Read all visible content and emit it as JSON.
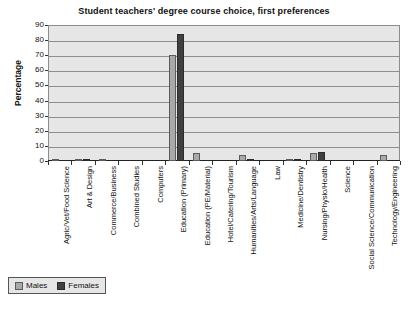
{
  "chart_data": {
    "type": "bar",
    "title": "Student teachers' degree course choice, first preferences",
    "xlabel": "",
    "ylabel": "Percentage",
    "ylim": [
      0,
      90
    ],
    "ytick_step": 10,
    "yticks": [
      0,
      10,
      20,
      30,
      40,
      50,
      60,
      70,
      80,
      90
    ],
    "grid": true,
    "legend_position": "bottom-left",
    "categories": [
      "Agric/Vet/Food Science",
      "Art & Design",
      "Commerce/Business",
      "Combined Studies",
      "Computers",
      "Education (Primary)",
      "Education (PE/Material)",
      "Hotel/Catering/Tourism",
      "Humanities/Arts/Language",
      "Law",
      "Medicine/Dentistry",
      "Nursing/Physio/Health",
      "Science",
      "Social Science/Communication",
      "Technology/Engineering"
    ],
    "series": [
      {
        "name": "Males",
        "color": "#a9a9a9",
        "values": [
          1,
          1,
          1,
          0,
          0,
          70,
          5,
          0,
          4,
          0,
          1,
          5,
          0,
          0,
          4
        ]
      },
      {
        "name": "Females",
        "color": "#404040",
        "values": [
          0,
          1,
          0,
          0,
          0,
          84,
          0,
          0,
          1,
          0,
          1,
          6,
          0,
          0,
          0
        ]
      }
    ]
  },
  "legend": {
    "items": [
      {
        "label": "Males"
      },
      {
        "label": "Females"
      }
    ]
  }
}
